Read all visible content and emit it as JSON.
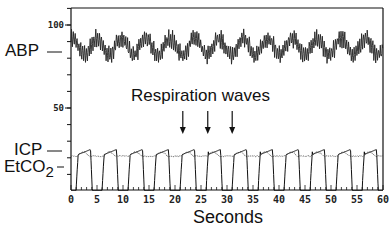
{
  "chart_data": {
    "type": "line",
    "title": "",
    "xlabel": "Seconds",
    "ylabel": "",
    "xlim": [
      0,
      60
    ],
    "ylim": [
      0,
      110
    ],
    "x_ticks": [
      0,
      5,
      10,
      15,
      20,
      25,
      30,
      35,
      40,
      45,
      50,
      55,
      60
    ],
    "y_ticks_labeled": [
      50,
      100
    ],
    "y_minor_tick_step": 10,
    "grid": false,
    "legend": "none (series labeled inline on left axis)",
    "annotation": {
      "text": "Respiration waves",
      "arrows_at_seconds": [
        21.5,
        26.3,
        31.0
      ]
    },
    "series": [
      {
        "name": "ABP",
        "label": "ABP",
        "label_level": 84,
        "style": "solid, dense cardiac pulsations",
        "description": "Arterial blood pressure oscillating ~80-98 with slow respiratory waves (period ~4.7 s) and fast cardiac pulses",
        "mean": 87,
        "slow_wave_period_s": 4.7,
        "slow_wave_amplitude": 5,
        "cardiac_amplitude": 4,
        "range": [
          78,
          100
        ]
      },
      {
        "name": "ICP",
        "label": "ICP",
        "label_level": 24,
        "style": "dotted-thin",
        "description": "Intracranial pressure, nearly flat ~21 with small respiratory bumps",
        "mean": 21,
        "range": [
          20,
          24
        ]
      },
      {
        "name": "EtCO2",
        "label": "EtCO2",
        "label_level": 14,
        "style": "solid",
        "description": "End-tidal CO2 capnogram, plateau ~23-25 dropping to ~0 each breath",
        "period_s": 5.0,
        "plateau": 24,
        "baseline": 0,
        "range": [
          0,
          25
        ]
      }
    ]
  },
  "labels": {
    "abp": "ABP",
    "icp": "ICP",
    "etco2_main": "EtCO",
    "etco2_sub": "2",
    "annotation": "Respiration waves",
    "xaxis": "Seconds",
    "ytick_100": "100",
    "ytick_50": "50"
  }
}
